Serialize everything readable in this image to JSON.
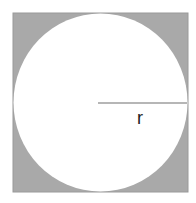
{
  "diagram": {
    "square": {
      "x": 13,
      "y": 13,
      "size": 175,
      "fill": "#a9a9a9",
      "stroke": "#9a9a9a"
    },
    "circle": {
      "cx": 100,
      "cy": 102.5,
      "r": 87,
      "fill": "#ffffff"
    },
    "radius_line": {
      "x1": 98,
      "y1": 103,
      "x2": 187,
      "y2": 103,
      "color": "#9e9e9e"
    },
    "radius_label": "r"
  }
}
